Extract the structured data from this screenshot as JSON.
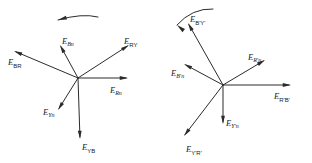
{
  "figure": {
    "type": "phasor-vector-diagram",
    "title": "",
    "background_color": "#ffffff",
    "line_color": "#2b2b2b",
    "width": 312,
    "height": 163,
    "diagrams": [
      {
        "id": "left-phasor-diagram",
        "name": "unshifted-phasor-star",
        "origin": {
          "x": 78,
          "y": 78
        },
        "rotation_indicator": {
          "name": "counterclockwise-rotation-arc",
          "direction": "counterclockwise",
          "arrow_end": "left"
        },
        "vectors": [
          {
            "id": "E_BR",
            "symbol": "E",
            "subscript": "BR",
            "prime": false,
            "label": "E_BR",
            "tip": {
              "x": 14,
              "y": 51
            },
            "angle_deg": 157,
            "length": 69,
            "label_pos": {
              "x": 8,
              "y": 63
            },
            "label_anchor": "start"
          },
          {
            "id": "E_Bn",
            "symbol": "E",
            "subscript": "Bn",
            "prime": false,
            "label": "E_Bn",
            "tip": {
              "x": 60,
              "y": 45
            },
            "angle_deg": 119,
            "length": 38,
            "label_pos": {
              "x": 62,
              "y": 42
            },
            "label_anchor": "start"
          },
          {
            "id": "E_RY",
            "symbol": "E",
            "subscript": "RY",
            "prime": false,
            "label": "E_RY",
            "tip": {
              "x": 129,
              "y": 45
            },
            "angle_deg": 30,
            "length": 60,
            "label_pos": {
              "x": 124,
              "y": 42
            },
            "label_anchor": "start"
          },
          {
            "id": "E_Rn",
            "symbol": "E",
            "subscript": "Rn",
            "prime": false,
            "label": "E_Rn",
            "tip": {
              "x": 128,
              "y": 78
            },
            "angle_deg": 0,
            "length": 50,
            "label_pos": {
              "x": 110,
              "y": 91
            },
            "label_anchor": "start"
          },
          {
            "id": "E_Yn",
            "symbol": "E",
            "subscript": "Yn",
            "prime": false,
            "label": "E_Yn",
            "tip": {
              "x": 58,
              "y": 110
            },
            "angle_deg": 238,
            "length": 38,
            "label_pos": {
              "x": 43,
              "y": 113
            },
            "label_anchor": "start"
          },
          {
            "id": "E_YB",
            "symbol": "E",
            "subscript": "YB",
            "prime": false,
            "label": "E_YB",
            "tip": {
              "x": 80,
              "y": 139
            },
            "angle_deg": 272,
            "length": 61,
            "label_pos": {
              "x": 82,
              "y": 148
            },
            "label_anchor": "start"
          }
        ]
      },
      {
        "id": "right-phasor-diagram",
        "name": "shifted-phasor-star",
        "origin": {
          "x": 223,
          "y": 85
        },
        "rotation_indicator": {
          "name": "counterclockwise-rotation-arc",
          "direction": "counterclockwise",
          "arrow_end": "left"
        },
        "vectors": [
          {
            "id": "E_BpYp",
            "symbol": "E",
            "subscript": "B'Y'",
            "prime": true,
            "label": "E_B'Y'",
            "tip": {
              "x": 188,
              "y": 23
            },
            "angle_deg": 119,
            "length": 71,
            "label_pos": {
              "x": 190,
              "y": 20
            },
            "label_anchor": "start"
          },
          {
            "id": "E_Bpn",
            "symbol": "E",
            "subscript": "B'n",
            "prime": true,
            "label": "E_B'n",
            "tip": {
              "x": 184,
              "y": 64
            },
            "angle_deg": 152,
            "length": 44,
            "label_pos": {
              "x": 171,
              "y": 74
            },
            "label_anchor": "start"
          },
          {
            "id": "E_Rpn",
            "symbol": "E",
            "subscript": "R'n",
            "prime": true,
            "label": "E_R'n",
            "tip": {
              "x": 265,
              "y": 60
            },
            "angle_deg": 30,
            "length": 48,
            "label_pos": {
              "x": 248,
              "y": 58
            },
            "label_anchor": "start"
          },
          {
            "id": "E_RpBp",
            "symbol": "E",
            "subscript": "R'B'",
            "prime": true,
            "label": "E_R'B'",
            "tip": {
              "x": 291,
              "y": 85
            },
            "angle_deg": 0,
            "length": 68,
            "label_pos": {
              "x": 274,
              "y": 97
            },
            "label_anchor": "start"
          },
          {
            "id": "E_Ypn",
            "symbol": "E",
            "subscript": "Y'n",
            "prime": true,
            "label": "E_Y'n",
            "tip": {
              "x": 223,
              "y": 124
            },
            "angle_deg": 270,
            "length": 39,
            "label_pos": {
              "x": 226,
              "y": 124
            },
            "label_anchor": "start"
          },
          {
            "id": "E_YpRp",
            "symbol": "E",
            "subscript": "Y'R'",
            "prime": true,
            "label": "E_Y'R'",
            "tip": {
              "x": 184,
              "y": 136
            },
            "angle_deg": 232,
            "length": 64,
            "label_pos": {
              "x": 186,
              "y": 150
            },
            "label_anchor": "start"
          }
        ]
      }
    ]
  }
}
